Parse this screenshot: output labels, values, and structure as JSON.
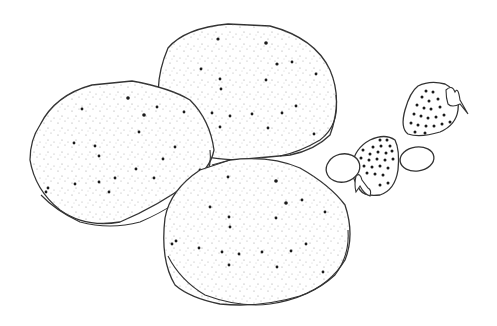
{
  "scene": {
    "title": "Pancakes with strawberries line art",
    "background": "#ffffff",
    "stroke_color": "#333333",
    "objects": [
      {
        "name": "pancake-back",
        "type": "pancake"
      },
      {
        "name": "pancake-left",
        "type": "pancake"
      },
      {
        "name": "pancake-front",
        "type": "pancake"
      },
      {
        "name": "strawberry-upper",
        "type": "strawberry"
      },
      {
        "name": "strawberry-lower",
        "type": "strawberry"
      },
      {
        "name": "berry-slice-left",
        "type": "oval"
      },
      {
        "name": "berry-slice-right",
        "type": "oval"
      }
    ]
  }
}
